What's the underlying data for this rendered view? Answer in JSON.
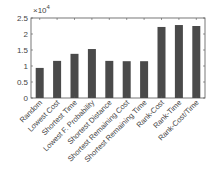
{
  "chart_data": {
    "type": "bar",
    "title": "",
    "xlabel": "",
    "ylabel": "",
    "y_multiplier_label": "×10",
    "y_multiplier_exponent": "4",
    "ylim": [
      0,
      2.5
    ],
    "yticks": [
      "0",
      "0.5",
      "1",
      "1.5",
      "2",
      "2.5"
    ],
    "grid": false,
    "legend": null,
    "bar_color": "#4a4a4a",
    "categories": [
      "Random",
      "Lowest Cost",
      "Shortest Time",
      "Lowest F. Probability",
      "Shortest Distance",
      "Shortest Remaining Cost",
      "Shortest Remaining Time",
      "Rank-Cost",
      "Rank-Time",
      "Rank-Cost/Time"
    ],
    "values": [
      0.94,
      1.16,
      1.38,
      1.53,
      1.16,
      1.15,
      1.15,
      2.22,
      2.28,
      2.25
    ],
    "values_scaled": [
      9400,
      11600,
      13800,
      15300,
      11600,
      11500,
      11500,
      22200,
      22800,
      22500
    ]
  }
}
